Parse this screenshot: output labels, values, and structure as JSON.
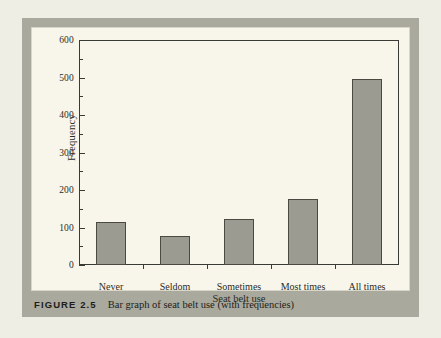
{
  "figure": {
    "caption_number": "FIGURE 2.5",
    "caption_text": "Bar graph of seat belt use (with frequencies)"
  },
  "colors": {
    "page_background": "#efeee4",
    "frame_band": "#a9a99d",
    "panel_background": "#f8f6ea",
    "bar_fill": "#9b9b92",
    "bar_outline": "#4a4a42",
    "axis": "#3a3a34",
    "text": "#2b2b26"
  },
  "chart_data": {
    "type": "bar",
    "title": "",
    "xlabel": "Seat belt use",
    "ylabel": "Frequency",
    "categories": [
      "Never",
      "Seldom",
      "Sometimes",
      "Most times",
      "All times"
    ],
    "values": [
      115,
      78,
      123,
      176,
      496
    ],
    "ylim": [
      0,
      600
    ],
    "ytick_labels": [
      "0",
      "100",
      "200",
      "300",
      "400",
      "500",
      "600"
    ],
    "ytick_values": [
      0,
      100,
      200,
      300,
      400,
      500,
      600
    ],
    "yminor_values": [
      50,
      150,
      250,
      350,
      450,
      550
    ],
    "grid": false,
    "legend": null
  }
}
